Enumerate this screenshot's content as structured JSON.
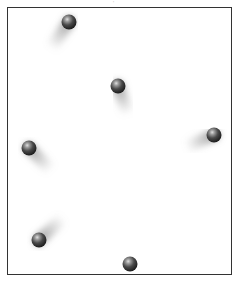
{
  "figure": {
    "top_mark": "'",
    "frame": {
      "x": 7,
      "y": 7,
      "width": 226,
      "height": 269,
      "color": "#333333"
    }
  },
  "balls": [
    {
      "id": 1,
      "cx": 69,
      "cy": 22,
      "trail_dx": -18,
      "trail_dy": 26
    },
    {
      "id": 2,
      "cx": 118,
      "cy": 86,
      "trail_dx": 10,
      "trail_dy": 28
    },
    {
      "id": 3,
      "cx": 214,
      "cy": 135,
      "trail_dx": -28,
      "trail_dy": 12
    },
    {
      "id": 4,
      "cx": 29,
      "cy": 148,
      "trail_dx": 22,
      "trail_dy": 22
    },
    {
      "id": 5,
      "cx": 39,
      "cy": 240,
      "trail_dx": 24,
      "trail_dy": -22
    },
    {
      "id": 6,
      "cx": 130,
      "cy": 264,
      "trail_dx": 0,
      "trail_dy": -30
    }
  ],
  "colors": {
    "ball_dark": "#1f1f1f",
    "ball_highlight": "#d8d8d8",
    "trail": "#9a9a9a",
    "background": "#ffffff"
  }
}
